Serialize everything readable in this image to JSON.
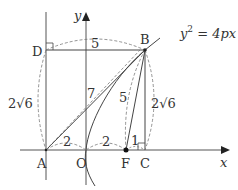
{
  "diagram": {
    "axes": {
      "x_label": "x",
      "y_label": "y",
      "origin_label": "O"
    },
    "curve_label": "y² = 4px",
    "curve_label_parts": {
      "base": "y",
      "exp": "2",
      "rest": " = 4px"
    },
    "points": {
      "A": "A",
      "B": "B",
      "C": "C",
      "D": "D",
      "F": "F",
      "O": "O"
    },
    "lengths": {
      "DB": "5",
      "AD": "2√6",
      "AB": "7",
      "BF": "5",
      "BC": "2√6",
      "AO": "2",
      "OF": "2",
      "FC": "1"
    },
    "colors": {
      "line": "#444444",
      "dashed": "#777777",
      "background": "#ffffff"
    }
  }
}
